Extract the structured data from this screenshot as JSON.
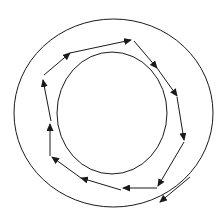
{
  "diagram": {
    "canvas": {
      "width": 224,
      "height": 220,
      "background": "#ffffff"
    },
    "stroke_color": "#1a1a1a",
    "outer_circle": {
      "cx": 113.5,
      "cy": 113,
      "rx": 99.5,
      "ry": 94
    },
    "inner_circle": {
      "cx": 112,
      "cy": 113,
      "rx": 55,
      "ry": 61
    },
    "path_segments": [
      {
        "from": [
          44,
          75
        ],
        "to": [
          70,
          53
        ]
      },
      {
        "from": [
          70,
          53
        ],
        "to": [
          131,
          40
        ]
      },
      {
        "from": [
          134,
          41
        ],
        "to": [
          157,
          68
        ]
      },
      {
        "from": [
          157,
          68
        ],
        "to": [
          177,
          96
        ]
      },
      {
        "from": [
          177,
          97
        ],
        "to": [
          184,
          140
        ]
      },
      {
        "from": [
          184,
          142
        ],
        "to": [
          158,
          186
        ]
      },
      {
        "from": [
          157,
          188
        ],
        "to": [
          123,
          188
        ]
      },
      {
        "from": [
          121,
          190
        ],
        "to": [
          81,
          178
        ]
      },
      {
        "from": [
          81,
          178
        ],
        "to": [
          52,
          157
        ]
      },
      {
        "from": [
          50,
          156
        ],
        "to": [
          50,
          124
        ]
      },
      {
        "from": [
          51,
          121
        ],
        "to": [
          43,
          80
        ]
      }
    ],
    "tangent_arrow": {
      "from": [
        190,
        177
      ],
      "to": [
        160,
        202
      ]
    }
  }
}
